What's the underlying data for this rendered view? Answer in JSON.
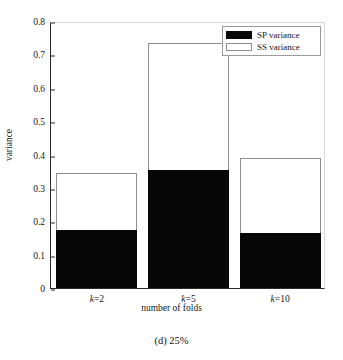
{
  "caption": "(d) 25%",
  "legend": {
    "position": "top-right",
    "entries": [
      {
        "label": "SP variance",
        "color": "#070707",
        "swatch": "filled-black"
      },
      {
        "label": "SS variance",
        "color": "#ffffff",
        "swatch": "outlined-white"
      }
    ]
  },
  "chart_data": {
    "type": "bar",
    "title": "",
    "subtitle": "",
    "categories": [
      "k=2",
      "k=5",
      "k=10"
    ],
    "xlabel": "number of folds",
    "ylabel": "variance",
    "ylim": [
      0,
      0.8
    ],
    "yticks": [
      0,
      0.1,
      0.2,
      0.3,
      0.4,
      0.5,
      0.6,
      0.7,
      0.8
    ],
    "ytick_labels": [
      "0",
      "0.1",
      "0.2",
      "0.3",
      "0.4",
      "0.5",
      "0.6",
      "0.7",
      "0.8"
    ],
    "grid": false,
    "stacked_overlay": true,
    "series": [
      {
        "name": "SS variance",
        "color": "#ffffff",
        "values": [
          0.345,
          0.735,
          0.39
        ]
      },
      {
        "name": "SP variance",
        "color": "#070707",
        "values": [
          0.175,
          0.355,
          0.165
        ]
      }
    ],
    "legend_position": "upper right",
    "annotations": []
  }
}
